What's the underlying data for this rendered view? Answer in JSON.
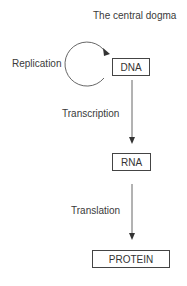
{
  "title": "The central dogma",
  "nodes": {
    "dna": "DNA",
    "rna": "RNA",
    "protein": "PROTEIN"
  },
  "processes": {
    "replication": "Replication",
    "transcription": "Transcription",
    "translation": "Translation"
  }
}
